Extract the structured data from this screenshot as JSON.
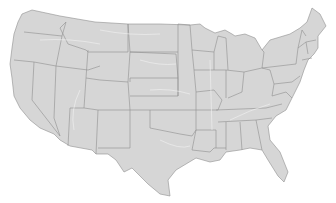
{
  "map": {
    "title": "",
    "region": "Contiguous United States",
    "fill_color": "#d6d6d6",
    "border_color": "#8e8e8e",
    "background_color": "#ffffff",
    "labels": []
  }
}
